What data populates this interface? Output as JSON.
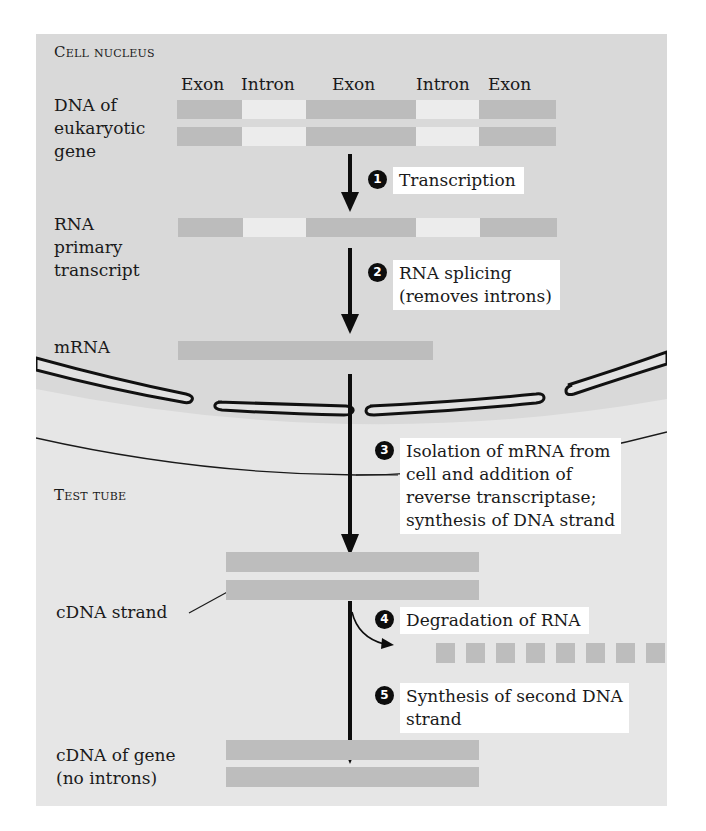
{
  "regions": {
    "nucleus_label": "Cell nucleus",
    "test_tube_label": "Test tube"
  },
  "labels": {
    "dna_gene": [
      "DNA of",
      "eukaryotic",
      "gene"
    ],
    "rna_primary": [
      "RNA",
      "primary",
      "transcript"
    ],
    "mrna": "mRNA",
    "cdna_strand": "cDNA strand",
    "cdna_gene": [
      "cDNA of gene",
      "(no introns)"
    ]
  },
  "segments": [
    "Exon",
    "Intron",
    "Exon",
    "Intron",
    "Exon"
  ],
  "steps": [
    {
      "number": "1",
      "lines": [
        "Transcription"
      ]
    },
    {
      "number": "2",
      "lines": [
        "RNA splicing",
        "(removes introns)"
      ]
    },
    {
      "number": "3",
      "lines": [
        "Isolation of mRNA from",
        "cell and addition of",
        "reverse transcriptase;",
        "synthesis of DNA strand"
      ]
    },
    {
      "number": "4",
      "lines": [
        "Degradation of RNA"
      ]
    },
    {
      "number": "5",
      "lines": [
        "Synthesis of second DNA",
        "strand"
      ]
    }
  ],
  "colors": {
    "nucleus_bg": "#d9d9d9",
    "test_tube_bg": "#e9e9e9",
    "exon": "#bcbcbc",
    "intron": "#ececec",
    "arrow": "#0d0d0d"
  }
}
